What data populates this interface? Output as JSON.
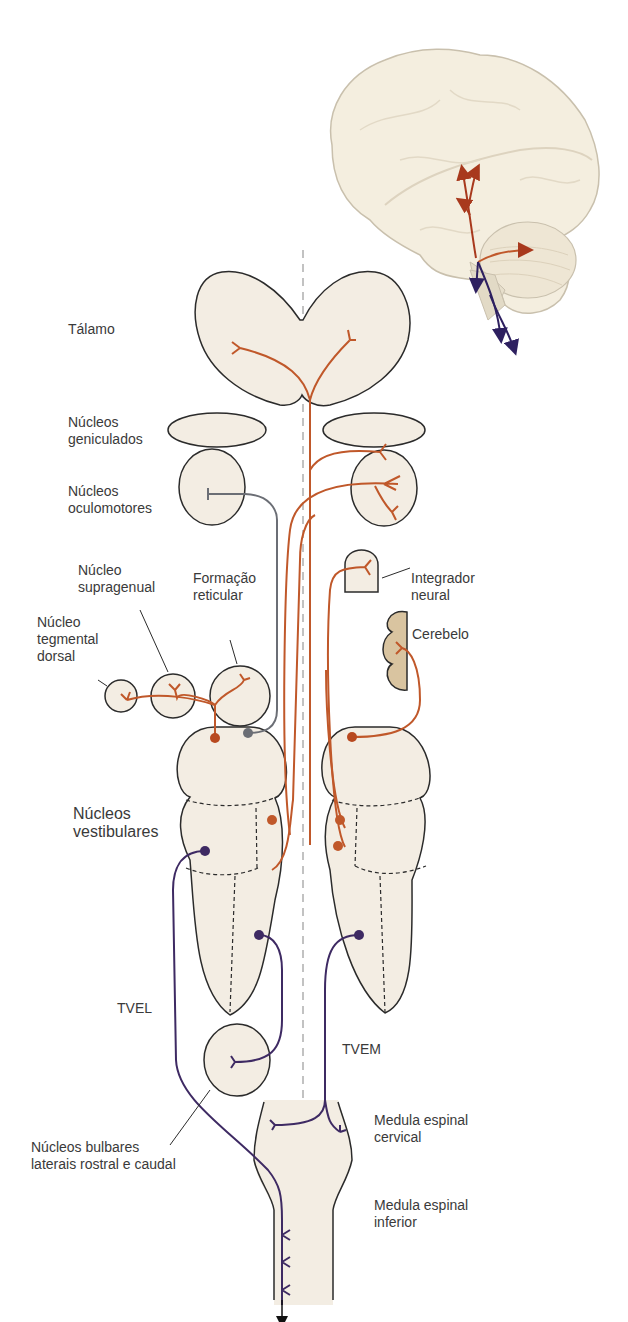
{
  "colors": {
    "nucleus_fill": "#f3ede3",
    "outline": "#2b2b2b",
    "ascending_path": "#c0582a",
    "descending_path": "#3e2a63",
    "inhibitory_path": "#6b6e75",
    "cerebellum_fill": "#d9c4a0",
    "midline": "#9a9a9a"
  },
  "labels": {
    "talamo": "Tálamo",
    "geniculados": "Núcleos\ngeniculados",
    "oculomotores": "Núcleos\noculomotores",
    "supragenual": "Núcleo\nsupragenual",
    "formacao_reticular": "Formação\nreticular",
    "tegmental_dorsal": "Núcleo\ntegmental\ndorsal",
    "integrador_neural": "Integrador\nneural",
    "cerebelo": "Cerebelo",
    "vestibulares": "Núcleos\nvestibulares",
    "tvel": "TVEL",
    "tvem": "TVEM",
    "bulbares": "Núcleos bulbares\nlaterais rostral e caudal",
    "medula_cervical": "Medula espinal\ncervical",
    "medula_inferior": "Medula espinal\ninferior"
  },
  "inset": {
    "description": "Lateral view of brain with brainstem; orange ascending arrows, purple descending arrows"
  }
}
